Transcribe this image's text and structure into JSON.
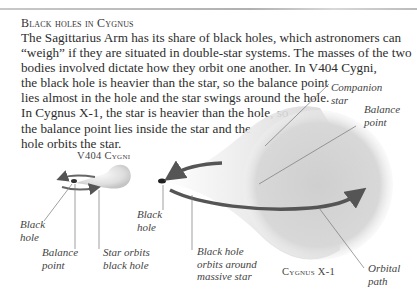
{
  "heading": "Black holes in Cygnus",
  "body_lines": [
    "The Sagittarius Arm has its share of black holes, which astronomers can",
    "“weigh” if they are situated in double-star systems. The masses of the two",
    "bodies involved dictate how they orbit one another. In V404 Cygni,",
    "the black hole is heavier than the star, so the balance point",
    "lies almost in the hole and the star swings around the hole.",
    "In Cygnus X-1, the star is heavier than the hole, so",
    "the balance point lies inside the star and the",
    "hole orbits the star."
  ],
  "v404": {
    "caption": "V404 Cygni",
    "labels": {
      "black_hole": [
        "Black",
        "hole"
      ],
      "balance_point": [
        "Balance",
        "point"
      ],
      "star_orbits": [
        "Star orbits",
        "black hole"
      ]
    }
  },
  "cygx1": {
    "caption": "Cygnus X-1",
    "labels": {
      "companion_star": [
        "Companion",
        "star"
      ],
      "balance_point": [
        "Balance",
        "point"
      ],
      "black_hole": [
        "Black",
        "hole"
      ],
      "bh_orbits": [
        "Black hole",
        "orbits around",
        "massive star"
      ],
      "orbital_path": [
        "Orbital",
        "path"
      ]
    }
  },
  "colors": {
    "arrow": "#555555",
    "leader": "#777777",
    "star_fill": "#d9d9d9"
  }
}
